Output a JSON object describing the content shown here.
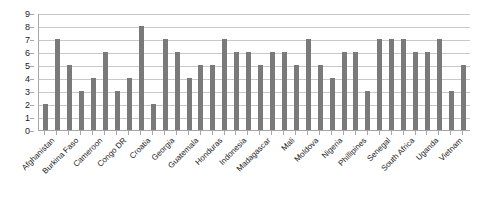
{
  "chart_data": {
    "type": "bar",
    "title": "",
    "subtitle": "",
    "xlabel": "",
    "ylabel": "",
    "ylim": [
      0,
      9
    ],
    "y_ticks": [
      0,
      1,
      2,
      3,
      4,
      5,
      6,
      7,
      8,
      9
    ],
    "grid": true,
    "legend": false,
    "legend_position": "none",
    "bar_color": "#7a7a7a",
    "axis_color": "#a6a6a6",
    "gridline_color": "#c9c9c9",
    "label_rotation_deg": -45,
    "tick_label_interval": 2,
    "categories": [
      "Afghanistan",
      "",
      "Burkina Faso",
      "",
      "Cameroon",
      "",
      "Congo DR",
      "",
      "Croatia",
      "",
      "Georgia",
      "",
      "Guatemala",
      "",
      "Honduras",
      "",
      "Indonesia",
      "",
      "Madagascar",
      "",
      "Mali",
      "",
      "Moldova",
      "",
      "Nigeria",
      "",
      "Phillipines",
      "",
      "Senegal",
      "",
      "South Africa",
      "",
      "Uganda",
      "",
      "Vietnam",
      ""
    ],
    "visible_tick_labels": [
      "Afghanistan",
      "Burkina Faso",
      "Cameroon",
      "Congo DR",
      "Croatia",
      "Georgia",
      "Guatemala",
      "Honduras",
      "Indonesia",
      "Madagascar",
      "Mali",
      "Moldova",
      "Nigeria",
      "Phillipines",
      "Senegal",
      "South Africa",
      "Uganda",
      "Vietnam"
    ],
    "values": [
      2,
      7,
      5,
      3,
      4,
      6,
      3,
      4,
      8,
      2,
      7,
      6,
      4,
      5,
      5,
      7,
      6,
      6,
      5,
      6,
      6,
      5,
      7,
      5,
      4,
      6,
      6,
      3,
      7,
      7,
      7,
      6,
      6,
      7,
      3,
      5
    ]
  }
}
